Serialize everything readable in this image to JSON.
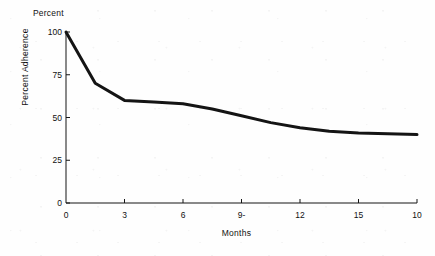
{
  "chart_data": {
    "type": "line",
    "title": "",
    "subtitle": "",
    "unit_caption": "Percent",
    "xlabel": "Months",
    "ylabel": "Percent Adherence",
    "xlim": [
      0,
      18
    ],
    "ylim": [
      0,
      100
    ],
    "grid": false,
    "legend": null,
    "x_tick_values": [
      0,
      3,
      6,
      9,
      12,
      15,
      18
    ],
    "x_tick_labels": [
      "0",
      "3",
      "6",
      "9-",
      "12",
      "15",
      "10"
    ],
    "y_tick_values": [
      0,
      25,
      50,
      75,
      100
    ],
    "y_tick_labels": [
      "0",
      "25",
      "50",
      "75",
      "100"
    ],
    "series": [
      {
        "name": "Percent Adherence",
        "color": "#141414",
        "line_width": 3,
        "x": [
          0,
          1.5,
          3,
          4.5,
          6,
          7.5,
          9,
          10.5,
          12,
          13.5,
          15,
          16.5,
          18
        ],
        "values": [
          100,
          70,
          60,
          59,
          58,
          55,
          51,
          47,
          44,
          42,
          41,
          40.5,
          40
        ]
      }
    ],
    "annotations": []
  },
  "axes": {
    "axis_color": "#141414",
    "tick_length": 4,
    "axis_line_width": 1
  }
}
